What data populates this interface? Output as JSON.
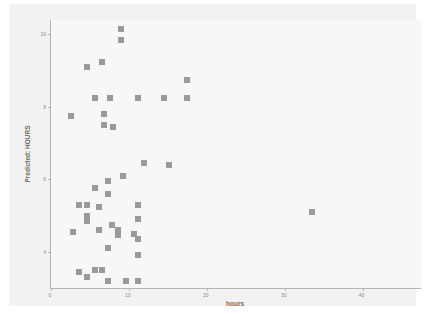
{
  "chart_data": {
    "type": "scatter",
    "title": "",
    "xlabel": "hours",
    "ylabel": "Predicted: HOURS",
    "xlim": [
      0,
      47.5
    ],
    "ylim": [
      3.0,
      10.4
    ],
    "xticks": [
      0,
      10,
      20,
      30,
      40
    ],
    "xtick_labels": [
      "0",
      "10",
      "20",
      "30",
      "40"
    ],
    "yticks": [
      4,
      6,
      8,
      10
    ],
    "ytick_labels": [
      "4",
      "6",
      "8",
      "10"
    ],
    "grid": false,
    "legend": null,
    "marker": {
      "shape": "square",
      "color": "#9a9a9a",
      "size": 6
    },
    "points": [
      {
        "x": 9.0,
        "y": 10.15
      },
      {
        "x": 9.0,
        "y": 9.85
      },
      {
        "x": 6.6,
        "y": 9.25
      },
      {
        "x": 4.6,
        "y": 9.1
      },
      {
        "x": 17.5,
        "y": 8.75
      },
      {
        "x": 5.6,
        "y": 8.25
      },
      {
        "x": 7.6,
        "y": 8.25
      },
      {
        "x": 11.2,
        "y": 8.25
      },
      {
        "x": 14.5,
        "y": 8.25
      },
      {
        "x": 17.5,
        "y": 8.25
      },
      {
        "x": 2.6,
        "y": 7.75
      },
      {
        "x": 6.8,
        "y": 7.8
      },
      {
        "x": 6.8,
        "y": 7.5
      },
      {
        "x": 8.0,
        "y": 7.45
      },
      {
        "x": 11.9,
        "y": 6.45
      },
      {
        "x": 15.2,
        "y": 6.4
      },
      {
        "x": 9.2,
        "y": 6.1
      },
      {
        "x": 5.6,
        "y": 5.75
      },
      {
        "x": 7.3,
        "y": 5.95
      },
      {
        "x": 7.3,
        "y": 5.6
      },
      {
        "x": 3.6,
        "y": 5.3
      },
      {
        "x": 4.6,
        "y": 5.3
      },
      {
        "x": 6.1,
        "y": 5.25
      },
      {
        "x": 11.2,
        "y": 5.3
      },
      {
        "x": 33.5,
        "y": 5.1
      },
      {
        "x": 4.6,
        "y": 5.0
      },
      {
        "x": 4.6,
        "y": 4.85
      },
      {
        "x": 11.2,
        "y": 4.9
      },
      {
        "x": 7.8,
        "y": 4.75
      },
      {
        "x": 6.1,
        "y": 4.6
      },
      {
        "x": 8.6,
        "y": 4.6
      },
      {
        "x": 8.6,
        "y": 4.45
      },
      {
        "x": 2.8,
        "y": 4.55
      },
      {
        "x": 10.6,
        "y": 4.5
      },
      {
        "x": 11.2,
        "y": 4.35
      },
      {
        "x": 7.3,
        "y": 4.1
      },
      {
        "x": 11.2,
        "y": 3.9
      },
      {
        "x": 5.6,
        "y": 3.5
      },
      {
        "x": 6.6,
        "y": 3.5
      },
      {
        "x": 3.6,
        "y": 3.45
      },
      {
        "x": 4.6,
        "y": 3.3
      },
      {
        "x": 7.3,
        "y": 3.2
      },
      {
        "x": 9.6,
        "y": 3.2
      },
      {
        "x": 11.2,
        "y": 3.2
      }
    ]
  }
}
